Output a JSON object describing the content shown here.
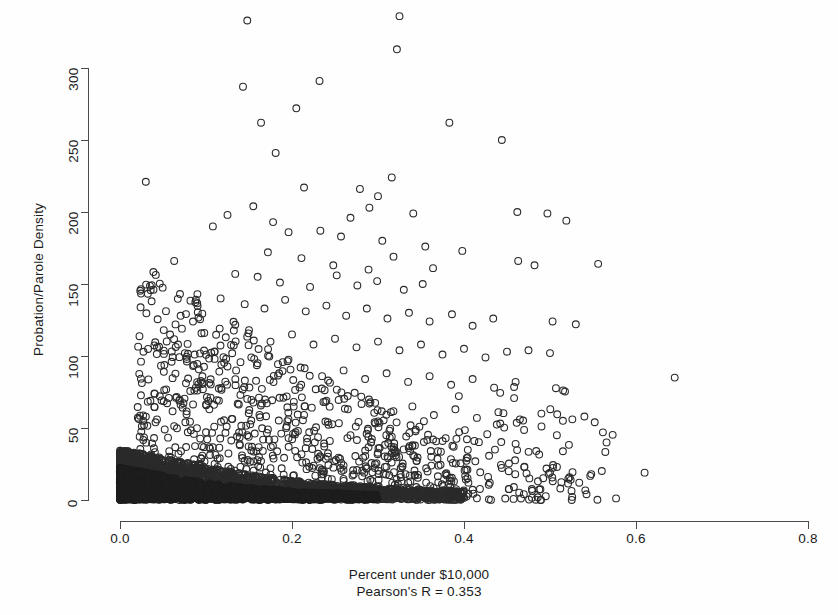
{
  "figure": {
    "background_color": "#ffffff",
    "point_color": "#2b2b2b",
    "axis_color": "#4a4a4a",
    "point_symbol": "open-circle"
  },
  "axes": {
    "y_title": "Probation/Parole Density",
    "x_caption_line1": "Percent under $10,000",
    "x_caption_line2": "Pearson's R = 0.353",
    "x_ticks": [
      "0.0",
      "0.2",
      "0.4",
      "0.6",
      "0.8"
    ],
    "y_ticks": [
      "0",
      "50",
      "100",
      "150",
      "200",
      "250",
      "300"
    ]
  },
  "scan_artifact_text": "",
  "chart_data": {
    "type": "scatter",
    "title": "",
    "subtitle": "",
    "xlabel": "Percent under $10,000",
    "ylabel": "Probation/Parole Density",
    "annotations": [
      "Pearson's R = 0.353"
    ],
    "pearson_r": 0.353,
    "grid": false,
    "legend": "none",
    "marker": {
      "shape": "circle",
      "filled": false,
      "size_px": 7,
      "stroke": "#2b2b2b"
    },
    "xlim": [
      0.0,
      0.8
    ],
    "ylim": [
      0,
      340
    ],
    "xticks": [
      0.0,
      0.2,
      0.4,
      0.6,
      0.8
    ],
    "yticks": [
      0,
      50,
      100,
      150,
      200,
      250,
      300
    ],
    "n_points_approx": 3100,
    "density_bands": [
      {
        "x_range": [
          0.0,
          0.07
        ],
        "y_range": [
          0,
          22
        ],
        "fill": "solid-black",
        "note": "saturated overplot core"
      },
      {
        "x_range": [
          0.0,
          0.22
        ],
        "y_range": [
          0,
          15
        ],
        "fill": "solid-black",
        "note": "saturated overplot band"
      },
      {
        "x_range": [
          0.22,
          0.33
        ],
        "y_range": [
          0,
          10
        ],
        "fill": "near-solid",
        "note": "dense band tapering"
      },
      {
        "x_range": [
          0.33,
          0.4
        ],
        "y_range": [
          0,
          6
        ],
        "fill": "dense",
        "note": "thin tail of band"
      }
    ],
    "series": [
      {
        "name": "counties",
        "points": [
          [
            0.148,
            333
          ],
          [
            0.325,
            336
          ],
          [
            0.322,
            313
          ],
          [
            0.143,
            287
          ],
          [
            0.232,
            291
          ],
          [
            0.205,
            272
          ],
          [
            0.164,
            262
          ],
          [
            0.383,
            262
          ],
          [
            0.181,
            241
          ],
          [
            0.444,
            250
          ],
          [
            0.03,
            221
          ],
          [
            0.214,
            217
          ],
          [
            0.279,
            216
          ],
          [
            0.3,
            211
          ],
          [
            0.316,
            224
          ],
          [
            0.155,
            204
          ],
          [
            0.29,
            203
          ],
          [
            0.125,
            198
          ],
          [
            0.178,
            193
          ],
          [
            0.268,
            196
          ],
          [
            0.341,
            199
          ],
          [
            0.497,
            199
          ],
          [
            0.462,
            200
          ],
          [
            0.519,
            194
          ],
          [
            0.108,
            190
          ],
          [
            0.196,
            186
          ],
          [
            0.233,
            187
          ],
          [
            0.257,
            183
          ],
          [
            0.305,
            180
          ],
          [
            0.355,
            176
          ],
          [
            0.063,
            166
          ],
          [
            0.172,
            172
          ],
          [
            0.211,
            168
          ],
          [
            0.248,
            163
          ],
          [
            0.289,
            160
          ],
          [
            0.318,
            169
          ],
          [
            0.364,
            161
          ],
          [
            0.398,
            173
          ],
          [
            0.463,
            166
          ],
          [
            0.482,
            163
          ],
          [
            0.556,
            164
          ],
          [
            0.134,
            157
          ],
          [
            0.16,
            155
          ],
          [
            0.186,
            151
          ],
          [
            0.221,
            148
          ],
          [
            0.252,
            156
          ],
          [
            0.276,
            149
          ],
          [
            0.299,
            152
          ],
          [
            0.33,
            146
          ],
          [
            0.352,
            150
          ],
          [
            0.09,
            143
          ],
          [
            0.117,
            140
          ],
          [
            0.145,
            136
          ],
          [
            0.168,
            133
          ],
          [
            0.192,
            139
          ],
          [
            0.216,
            131
          ],
          [
            0.24,
            135
          ],
          [
            0.263,
            128
          ],
          [
            0.287,
            133
          ],
          [
            0.311,
            126
          ],
          [
            0.336,
            130
          ],
          [
            0.36,
            124
          ],
          [
            0.386,
            129
          ],
          [
            0.41,
            121
          ],
          [
            0.434,
            126
          ],
          [
            0.503,
            124
          ],
          [
            0.53,
            122
          ],
          [
            0.072,
            119
          ],
          [
            0.098,
            116
          ],
          [
            0.123,
            113
          ],
          [
            0.15,
            118
          ],
          [
            0.175,
            110
          ],
          [
            0.2,
            115
          ],
          [
            0.225,
            108
          ],
          [
            0.25,
            112
          ],
          [
            0.275,
            106
          ],
          [
            0.3,
            110
          ],
          [
            0.325,
            104
          ],
          [
            0.35,
            108
          ],
          [
            0.375,
            101
          ],
          [
            0.4,
            105
          ],
          [
            0.425,
            99
          ],
          [
            0.45,
            103
          ],
          [
            0.475,
            104
          ],
          [
            0.5,
            102
          ],
          [
            0.06,
            96
          ],
          [
            0.085,
            93
          ],
          [
            0.11,
            98
          ],
          [
            0.135,
            90
          ],
          [
            0.16,
            95
          ],
          [
            0.185,
            88
          ],
          [
            0.21,
            92
          ],
          [
            0.235,
            86
          ],
          [
            0.26,
            90
          ],
          [
            0.285,
            84
          ],
          [
            0.31,
            88
          ],
          [
            0.335,
            82
          ],
          [
            0.36,
            86
          ],
          [
            0.385,
            80
          ],
          [
            0.41,
            84
          ],
          [
            0.435,
            78
          ],
          [
            0.46,
            82
          ],
          [
            0.645,
            85
          ],
          [
            0.04,
            74
          ],
          [
            0.065,
            71
          ],
          [
            0.09,
            76
          ],
          [
            0.115,
            69
          ],
          [
            0.14,
            73
          ],
          [
            0.165,
            67
          ],
          [
            0.19,
            71
          ],
          [
            0.215,
            65
          ],
          [
            0.24,
            69
          ],
          [
            0.265,
            63
          ],
          [
            0.29,
            67
          ],
          [
            0.315,
            61
          ],
          [
            0.34,
            65
          ],
          [
            0.365,
            59
          ],
          [
            0.39,
            63
          ],
          [
            0.415,
            57
          ],
          [
            0.44,
            61
          ],
          [
            0.465,
            56
          ],
          [
            0.49,
            60
          ],
          [
            0.515,
            55
          ],
          [
            0.54,
            58
          ],
          [
            0.028,
            52
          ],
          [
            0.052,
            49
          ],
          [
            0.076,
            54
          ],
          [
            0.1,
            47
          ],
          [
            0.124,
            51
          ],
          [
            0.148,
            45
          ],
          [
            0.172,
            49
          ],
          [
            0.196,
            43
          ],
          [
            0.22,
            47
          ],
          [
            0.244,
            41
          ],
          [
            0.268,
            45
          ],
          [
            0.292,
            40
          ],
          [
            0.316,
            44
          ],
          [
            0.34,
            38
          ],
          [
            0.364,
            42
          ],
          [
            0.388,
            37
          ],
          [
            0.412,
            41
          ],
          [
            0.436,
            35
          ],
          [
            0.46,
            39
          ],
          [
            0.484,
            34
          ],
          [
            0.508,
            45
          ],
          [
            0.526,
            56
          ],
          [
            0.552,
            54
          ],
          [
            0.02,
            30
          ],
          [
            0.044,
            27
          ],
          [
            0.068,
            32
          ],
          [
            0.092,
            25
          ],
          [
            0.116,
            29
          ],
          [
            0.14,
            23
          ],
          [
            0.164,
            27
          ],
          [
            0.188,
            22
          ],
          [
            0.212,
            26
          ],
          [
            0.236,
            20
          ],
          [
            0.26,
            24
          ],
          [
            0.284,
            19
          ],
          [
            0.308,
            23
          ],
          [
            0.332,
            18
          ],
          [
            0.356,
            22
          ],
          [
            0.38,
            17
          ],
          [
            0.404,
            21
          ],
          [
            0.428,
            16
          ],
          [
            0.452,
            20
          ],
          [
            0.476,
            15
          ],
          [
            0.5,
            19
          ],
          [
            0.524,
            14
          ],
          [
            0.548,
            18
          ],
          [
            0.61,
            19
          ],
          [
            0.43,
            12
          ],
          [
            0.458,
            9
          ],
          [
            0.486,
            13
          ],
          [
            0.512,
            8
          ],
          [
            0.534,
            12
          ]
        ]
      }
    ]
  }
}
